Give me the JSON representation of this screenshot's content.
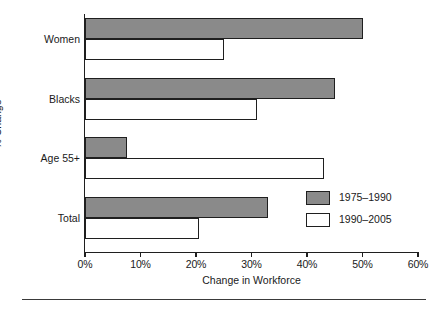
{
  "chart_data": {
    "type": "bar",
    "orientation": "horizontal",
    "title": "",
    "xlabel": "Change in Workforce",
    "ylabel": "% Change",
    "categories": [
      "Women",
      "Blacks",
      "Age 55+",
      "Total"
    ],
    "series": [
      {
        "name": "1975–1990",
        "color": "#8a8a8a",
        "values": [
          50,
          45,
          7.5,
          33
        ]
      },
      {
        "name": "1990–2005",
        "color": "#ffffff",
        "values": [
          25,
          31,
          43,
          20.5
        ]
      }
    ],
    "xlim": [
      0,
      60
    ],
    "xticks": [
      0,
      10,
      20,
      30,
      40,
      50,
      60
    ],
    "xtick_labels": [
      "0%",
      "10%",
      "20%",
      "30%",
      "40%",
      "50%",
      "60%"
    ],
    "grid": false,
    "legend_position": "bottom-right"
  },
  "legend": {
    "entries": [
      {
        "label": "1975–1990"
      },
      {
        "label": "1990–2005"
      }
    ]
  },
  "axes": {
    "x_title": "Change in Workforce",
    "y_title": "% Change"
  },
  "colors": {
    "bar_fill_period1": "#8a8a8a",
    "bar_fill_period2": "#ffffff",
    "outline": "#1f1f1f",
    "background": "#ffffff"
  }
}
